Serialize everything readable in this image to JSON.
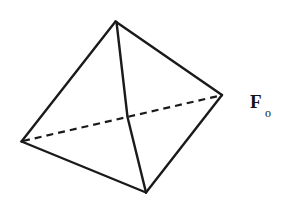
{
  "figure": {
    "name": "tetrahedron-diagram",
    "background_color": "#ffffff",
    "stroke_color": "#1a1a1a",
    "label": {
      "base": "F",
      "subscript": "o",
      "full_text": "Fo",
      "x": 250,
      "y": 92
    },
    "vertices": [
      {
        "id": "top",
        "x": 115,
        "y": 21
      },
      {
        "id": "left",
        "x": 21,
        "y": 141
      },
      {
        "id": "right",
        "x": 222,
        "y": 95
      },
      {
        "id": "bottom",
        "x": 146,
        "y": 193
      }
    ],
    "edges": [
      {
        "from": "top",
        "to": "left",
        "style": "solid"
      },
      {
        "from": "top",
        "to": "right",
        "style": "solid"
      },
      {
        "from": "top",
        "to": "bottom",
        "style": "solid"
      },
      {
        "from": "left",
        "to": "bottom",
        "style": "solid"
      },
      {
        "from": "right",
        "to": "bottom",
        "style": "solid"
      },
      {
        "from": "left",
        "to": "right",
        "style": "dashed"
      }
    ],
    "paths": {
      "edge_top_left": "M 115.5 21.5 L 21.5 141.5",
      "edge_top_right": "M 115.5 21.5 L 222 95",
      "edge_top_bottom": "M 116.5 22 L 127.5 117 L 146 192.5",
      "edge_left_bottom": "M 21.5 141.5 L 146 192.5",
      "edge_right_bottom": "M 222 95 L 146 192.5",
      "edge_left_right_hidden": "M 23 141 L 220.5 95.5"
    }
  }
}
